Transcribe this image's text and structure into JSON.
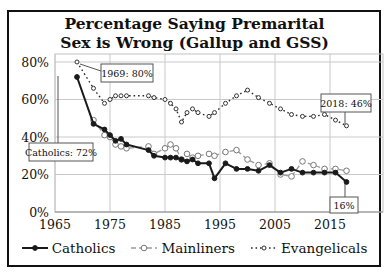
{
  "title": {
    "line1": "Percentage Saying Premarital",
    "line2": "Sex is Wrong (Gallup and GSS)"
  },
  "colors": {
    "background": "#ffffff",
    "frame_border": "#111111",
    "gridline": "#c9c9c9",
    "plot_border": "#c2c2c2",
    "axis_line": "#8c8c8c",
    "text": "#111111",
    "annotation_border": "#555555",
    "annotation_fill": "#ffffff",
    "leader_line": "#555555"
  },
  "chart_data": {
    "type": "line",
    "title": "Percentage Saying Premarital Sex is Wrong (Gallup and GSS)",
    "xlabel": "",
    "ylabel": "",
    "xlim": [
      1965,
      2025
    ],
    "ylim": [
      0,
      84
    ],
    "grid": true,
    "legend_position": "bottom",
    "x_ticks": [
      1965,
      1975,
      1985,
      1995,
      2005,
      2015
    ],
    "y_ticks": [
      {
        "value": 0,
        "label": "0%"
      },
      {
        "value": 20,
        "label": "20%"
      },
      {
        "value": 40,
        "label": "40%"
      },
      {
        "value": 60,
        "label": "60%"
      },
      {
        "value": 80,
        "label": "80%"
      }
    ],
    "series": [
      {
        "name": "Evangelicals",
        "color": "#2a2a2a",
        "dash": "1.6 2.9",
        "width": 1.4,
        "marker": {
          "r": 2.0,
          "fill": "#ffffff",
          "stroke": "#333333"
        },
        "points": [
          [
            1969,
            80
          ],
          [
            1972,
            66
          ],
          [
            1974,
            58
          ],
          [
            1975,
            60
          ],
          [
            1976,
            62
          ],
          [
            1977,
            62
          ],
          [
            1978,
            62
          ],
          [
            1982,
            62
          ],
          [
            1983,
            61
          ],
          [
            1985,
            60
          ],
          [
            1986,
            58
          ],
          [
            1987,
            55
          ],
          [
            1988,
            48
          ],
          [
            1989,
            53
          ],
          [
            1990,
            55
          ],
          [
            1991,
            53
          ],
          [
            1993,
            51
          ],
          [
            1994,
            53
          ],
          [
            1996,
            58
          ],
          [
            1998,
            62
          ],
          [
            2000,
            65
          ],
          [
            2002,
            61
          ],
          [
            2004,
            58
          ],
          [
            2006,
            55
          ],
          [
            2008,
            52
          ],
          [
            2010,
            51
          ],
          [
            2012,
            51
          ],
          [
            2014,
            52
          ],
          [
            2016,
            49
          ],
          [
            2018,
            46
          ]
        ]
      },
      {
        "name": "Mainliners",
        "color": "#9a9a9a",
        "dash": "5 3",
        "width": 1.3,
        "marker": {
          "r": 2.8,
          "fill": "#ffffff",
          "stroke": "#777777"
        },
        "points": [
          [
            1972,
            49
          ],
          [
            1974,
            41
          ],
          [
            1975,
            40
          ],
          [
            1976,
            36
          ],
          [
            1977,
            35
          ],
          [
            1978,
            34
          ],
          [
            1982,
            35
          ],
          [
            1983,
            31
          ],
          [
            1985,
            34
          ],
          [
            1986,
            36
          ],
          [
            1987,
            34
          ],
          [
            1988,
            28
          ],
          [
            1989,
            31
          ],
          [
            1990,
            29
          ],
          [
            1991,
            30
          ],
          [
            1993,
            31
          ],
          [
            1994,
            30
          ],
          [
            1996,
            32
          ],
          [
            1998,
            33
          ],
          [
            2000,
            28
          ],
          [
            2002,
            25
          ],
          [
            2004,
            26
          ],
          [
            2006,
            20
          ],
          [
            2008,
            19
          ],
          [
            2010,
            27
          ],
          [
            2012,
            25
          ],
          [
            2014,
            23
          ],
          [
            2016,
            23
          ],
          [
            2018,
            22
          ]
        ]
      },
      {
        "name": "Catholics",
        "color": "#1a1a1a",
        "dash": "",
        "width": 2,
        "marker": {
          "r": 2.4,
          "fill": "#1a1a1a",
          "stroke": "#1a1a1a"
        },
        "points": [
          [
            1969,
            72
          ],
          [
            1972,
            47
          ],
          [
            1974,
            44
          ],
          [
            1975,
            41
          ],
          [
            1976,
            38
          ],
          [
            1977,
            39
          ],
          [
            1978,
            36
          ],
          [
            1982,
            33
          ],
          [
            1983,
            30
          ],
          [
            1985,
            29
          ],
          [
            1986,
            29
          ],
          [
            1987,
            29
          ],
          [
            1988,
            28
          ],
          [
            1989,
            27
          ],
          [
            1990,
            28
          ],
          [
            1991,
            26
          ],
          [
            1993,
            26
          ],
          [
            1994,
            18
          ],
          [
            1996,
            26
          ],
          [
            1998,
            23
          ],
          [
            2000,
            23
          ],
          [
            2002,
            22
          ],
          [
            2004,
            25
          ],
          [
            2006,
            21
          ],
          [
            2008,
            23
          ],
          [
            2010,
            21
          ],
          [
            2012,
            21
          ],
          [
            2014,
            21
          ],
          [
            2016,
            21
          ],
          [
            2018,
            16
          ]
        ]
      }
    ],
    "annotations": [
      {
        "text": "1969: 80%",
        "box": {
          "x": 101,
          "y": 64,
          "w": 52,
          "h": 18
        },
        "leader": [
          [
            80,
            64
          ],
          [
            101,
            71
          ]
        ]
      },
      {
        "text": "Catholics: 72%",
        "box": {
          "x": 29,
          "y": 143,
          "w": 64,
          "h": 18
        },
        "leader": [
          [
            58,
            76
          ],
          [
            58,
            143
          ]
        ]
      },
      {
        "text": "2018: 46%",
        "box": {
          "x": 321,
          "y": 94,
          "w": 50,
          "h": 18
        },
        "leader": [
          [
            345,
            124
          ],
          [
            345,
            112
          ]
        ]
      },
      {
        "text": "16%",
        "box": {
          "x": 330,
          "y": 197,
          "w": 28,
          "h": 16
        },
        "leader": [
          [
            345,
            184
          ],
          [
            345,
            197
          ]
        ]
      }
    ]
  },
  "legend": {
    "items": [
      {
        "label": "Catholics",
        "series": "Catholics"
      },
      {
        "label": "Mainliners",
        "series": "Mainliners"
      },
      {
        "label": "Evangelicals",
        "series": "Evangelicals"
      }
    ]
  }
}
